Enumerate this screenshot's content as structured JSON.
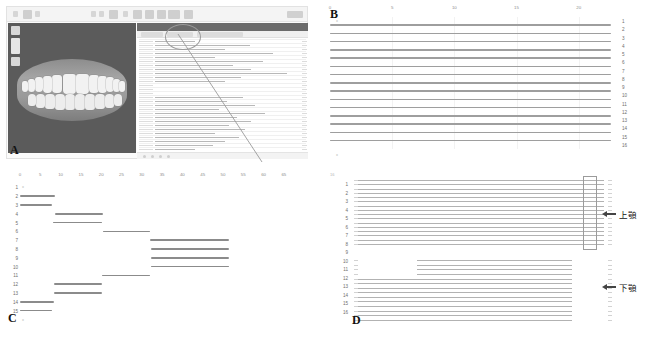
{
  "figure": {
    "width": 653,
    "height": 340,
    "background": "#ffffff"
  },
  "panels": [
    {
      "id": "A",
      "label": "A",
      "caption": "orthodontic planning software screenshot with 3D dentition model and treatment Gantt chart"
    },
    {
      "id": "B",
      "label": "B",
      "caption": "Gantt chart, 16 rows, all stages spanning the full timeline"
    },
    {
      "id": "C",
      "label": "C",
      "caption": "Gantt chart, 15 rows, staggered/stepped sequential stages"
    },
    {
      "id": "D",
      "label": "D",
      "caption": "Gantt chart split into upper jaw and lower jaw groups, 16 rows"
    }
  ],
  "panelA": {
    "label": "A",
    "toolbar": {
      "icons": [
        "menu-icon",
        "document-icon",
        "chevron-down-icon",
        "undo-icon",
        "redo-icon",
        "measure-icon",
        "align-icon",
        "segment-icon",
        "attachment-icon",
        "compare-icon",
        "export-icon"
      ],
      "window_controls": "window-controls"
    },
    "viewport": {
      "name": "3d-dentition-viewport",
      "background_color": "#5b5b5b",
      "model": "upper-and-lower-dental-arch",
      "tools": [
        "zoom-in-button",
        "zoom-slider",
        "zoom-out-button"
      ]
    },
    "timeline_panel": {
      "name": "treatment-stage-gantt",
      "rows": 28,
      "tabs": [
        "tab-1",
        "tab-2",
        "tab-3"
      ]
    },
    "callout": {
      "name": "zoom-callout-circle",
      "shape": "ellipse",
      "leader": "leader-line"
    }
  },
  "chart_data": [
    {
      "panel": "B",
      "type": "bar",
      "orientation": "horizontal",
      "title": "",
      "xlabel": "",
      "ylabel": "",
      "xlim": [
        0,
        23
      ],
      "xticks": [
        0,
        5,
        10,
        15,
        20
      ],
      "xticklabels": [
        "0",
        "5",
        "10",
        "15",
        "20"
      ],
      "grid": true,
      "categories": [
        "1",
        "2",
        "3",
        "4",
        "5",
        "6",
        "7",
        "8",
        "9",
        "10",
        "11",
        "12",
        "13",
        "14",
        "15",
        "16"
      ],
      "bars": [
        {
          "row": 1,
          "start": 0,
          "end": 22.6
        },
        {
          "row": 2,
          "start": 0,
          "end": 22.6
        },
        {
          "row": 3,
          "start": 0,
          "end": 22.6
        },
        {
          "row": 4,
          "start": 0,
          "end": 22.6
        },
        {
          "row": 5,
          "start": 0,
          "end": 22.6
        },
        {
          "row": 6,
          "start": 0,
          "end": 22.6
        },
        {
          "row": 7,
          "start": 0,
          "end": 22.6
        },
        {
          "row": 8,
          "start": 0,
          "end": 22.6
        },
        {
          "row": 9,
          "start": 0,
          "end": 22.6
        },
        {
          "row": 10,
          "start": 0,
          "end": 22.6
        },
        {
          "row": 11,
          "start": 0,
          "end": 22.6
        },
        {
          "row": 12,
          "start": 0,
          "end": 22.6
        },
        {
          "row": 13,
          "start": 0,
          "end": 22.6
        },
        {
          "row": 14,
          "start": 0,
          "end": 22.6
        },
        {
          "row": 15,
          "start": 0,
          "end": 22.6
        }
      ],
      "bar_color": "#9e9e9e"
    },
    {
      "panel": "C",
      "type": "bar",
      "orientation": "horizontal",
      "title": "",
      "xlabel": "",
      "ylabel": "",
      "xlim": [
        0,
        67
      ],
      "xticks": [
        0,
        5,
        10,
        15,
        20,
        25,
        30,
        35,
        40,
        45,
        50,
        55,
        60,
        65
      ],
      "xticklabels": [
        "0",
        "5",
        "10",
        "15",
        "20",
        "25",
        "30",
        "35",
        "40",
        "45",
        "50",
        "55",
        "60",
        "65"
      ],
      "grid": false,
      "categories": [
        "1",
        "2",
        "3",
        "4",
        "5",
        "6",
        "7",
        "8",
        "9",
        "10",
        "11",
        "12",
        "13",
        "14",
        "15"
      ],
      "bars": [
        {
          "row": 2,
          "start": 0,
          "end": 8.5
        },
        {
          "row": 3,
          "start": 0,
          "end": 7.8
        },
        {
          "row": 4,
          "start": 8.5,
          "end": 20.5
        },
        {
          "row": 5,
          "start": 8.2,
          "end": 20.3
        },
        {
          "row": 6,
          "start": 20.5,
          "end": 32.0
        },
        {
          "row": 7,
          "start": 32.0,
          "end": 51.5
        },
        {
          "row": 8,
          "start": 32.2,
          "end": 51.5
        },
        {
          "row": 9,
          "start": 32.2,
          "end": 51.5
        },
        {
          "row": 10,
          "start": 32.2,
          "end": 51.5
        },
        {
          "row": 11,
          "start": 20.3,
          "end": 32.0
        },
        {
          "row": 12,
          "start": 8.3,
          "end": 20.3
        },
        {
          "row": 13,
          "start": 8.3,
          "end": 20.3
        },
        {
          "row": 14,
          "start": 0,
          "end": 8.3
        },
        {
          "row": 15,
          "start": 0,
          "end": 8.0
        }
      ],
      "bar_color": "#8b8b8b"
    },
    {
      "panel": "D",
      "type": "bar",
      "orientation": "horizontal",
      "title": "",
      "xlabel": "",
      "ylabel": "",
      "grid": false,
      "categories": [
        "1",
        "2",
        "3",
        "4",
        "5",
        "6",
        "7",
        "8",
        "9",
        "10",
        "11",
        "12",
        "13",
        "14",
        "15",
        "16"
      ],
      "groups": [
        {
          "name": "上顎",
          "annotation": "上顎",
          "annotation_icon": "arrow-left-icon",
          "bar_count": 16,
          "start": 0.0,
          "end": 1.0,
          "highlight_box": {
            "start": 0.915,
            "end": 0.965,
            "name": "final-stage-highlight"
          }
        },
        {
          "name": "下顎",
          "annotation": "下顎",
          "annotation_icon": "arrow-left-icon",
          "bar_count": 14,
          "offset_bars": 4,
          "offset_start": 0.25,
          "start": 0.0,
          "end": 0.87
        }
      ],
      "bar_color": "#b2b2b2"
    }
  ],
  "annotations": {
    "upper_jaw": "上顎",
    "lower_jaw": "下顎"
  }
}
